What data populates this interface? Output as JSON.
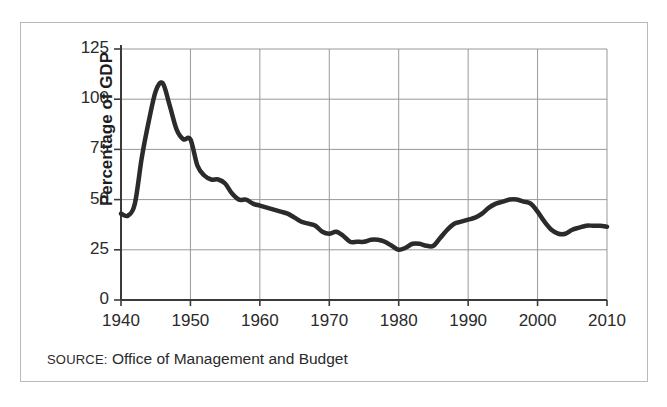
{
  "figure": {
    "source_prefix": "SOURCE:",
    "source_text": " Office of Management and Budget",
    "border_color": "#b9b9b9",
    "background_color": "#ffffff"
  },
  "chart_data": {
    "type": "line",
    "title": "",
    "subtitle": "",
    "xlabel": "",
    "ylabel": "Percentage of GDP",
    "xlim": [
      1940,
      2010
    ],
    "ylim": [
      0,
      125
    ],
    "ytick_labels": [
      "0",
      "25",
      "50",
      "75",
      "100",
      "125"
    ],
    "yticks": [
      0,
      25,
      50,
      75,
      100,
      125
    ],
    "xtick_labels": [
      "1940",
      "1950",
      "1960",
      "1970",
      "1980",
      "1990",
      "2000",
      "2010"
    ],
    "xticks": [
      1940,
      1950,
      1960,
      1970,
      1980,
      1990,
      2000,
      2010
    ],
    "grid": true,
    "grid_color": "#999999",
    "axis_color": "#3a3a3a",
    "legend": false,
    "legend_position": "none",
    "line_color": "#2b2b2b",
    "line_width": 4.5,
    "series": [
      {
        "name": "Federal debt held by the public as percentage of GDP",
        "x": [
          1940,
          1941,
          1942,
          1943,
          1944,
          1945,
          1946,
          1947,
          1948,
          1949,
          1950,
          1951,
          1952,
          1953,
          1954,
          1955,
          1956,
          1957,
          1958,
          1959,
          1960,
          1961,
          1962,
          1963,
          1964,
          1965,
          1966,
          1967,
          1968,
          1969,
          1970,
          1971,
          1972,
          1973,
          1974,
          1975,
          1976,
          1977,
          1978,
          1979,
          1980,
          1981,
          1982,
          1983,
          1984,
          1985,
          1986,
          1987,
          1988,
          1989,
          1990,
          1991,
          1992,
          1993,
          1994,
          1995,
          1996,
          1997,
          1998,
          1999,
          2000,
          2001,
          2002,
          2003,
          2004,
          2005,
          2006,
          2007,
          2008,
          2009,
          2010
        ],
        "values": [
          43,
          42,
          48,
          71,
          89,
          104,
          108,
          97,
          85,
          80,
          80,
          67,
          62,
          60,
          60,
          58,
          53,
          50,
          50,
          48,
          47,
          46,
          45,
          44,
          43,
          41,
          39,
          38,
          37,
          34,
          33,
          34,
          32,
          29,
          29,
          29,
          30,
          30,
          29,
          27,
          25,
          26,
          28,
          28,
          27,
          27,
          31,
          35,
          38,
          39,
          40,
          41,
          43,
          46,
          48,
          49,
          50,
          50,
          49,
          48,
          44,
          39,
          35,
          33,
          33,
          35,
          36,
          37,
          37,
          37,
          36.5
        ]
      }
    ]
  },
  "axes": {
    "y_title": "Percentage of GDP"
  }
}
